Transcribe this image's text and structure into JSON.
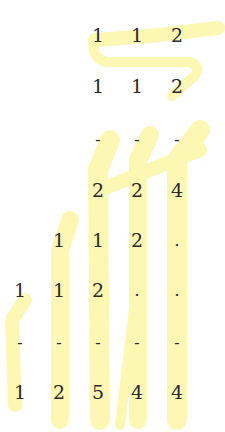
{
  "document": {
    "description": "Long multiplication worksheet with yellow highlighter marks",
    "highlight_color": "#fdf6a8",
    "text_color": "#2a2a2a",
    "columns_x": [
      20,
      59,
      98,
      137,
      177
    ],
    "rows": [
      {
        "name": "multiplicand",
        "y": 35,
        "cells": [
          "",
          "",
          "1",
          "1",
          "2"
        ]
      },
      {
        "name": "multiplier",
        "y": 86,
        "cells": [
          "",
          "",
          "1",
          "1",
          "2"
        ]
      },
      {
        "name": "rule-1",
        "y": 140,
        "cells": [
          "",
          "",
          "-",
          "-",
          "-"
        ]
      },
      {
        "name": "partial-1",
        "y": 190,
        "cells": [
          "",
          "",
          "2",
          "2",
          "4"
        ]
      },
      {
        "name": "partial-2",
        "y": 240,
        "cells": [
          "",
          "1",
          "1",
          "2",
          "."
        ]
      },
      {
        "name": "partial-3",
        "y": 290,
        "cells": [
          "1",
          "1",
          "2",
          ".",
          "."
        ]
      },
      {
        "name": "rule-2",
        "y": 343,
        "cells": [
          "-",
          "-",
          "-",
          "-",
          "-"
        ]
      },
      {
        "name": "result",
        "y": 392,
        "cells": [
          "1",
          "2",
          "5",
          "4",
          "4"
        ]
      }
    ]
  }
}
